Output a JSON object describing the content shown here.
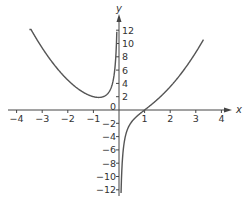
{
  "chart_data": {
    "type": "line",
    "title": "",
    "xlabel": "x",
    "ylabel": "y",
    "xlim": [
      -4.2,
      4.4
    ],
    "ylim": [
      -13,
      13
    ],
    "grid": false,
    "legend": "none",
    "x_ticks": [
      {
        "value": -4,
        "label": "−4"
      },
      {
        "value": -3,
        "label": "−3"
      },
      {
        "value": -2,
        "label": "−2"
      },
      {
        "value": -1,
        "label": "−1"
      },
      {
        "value": 1,
        "label": "1"
      },
      {
        "value": 2,
        "label": "2"
      },
      {
        "value": 3,
        "label": "3"
      },
      {
        "value": 4,
        "label": "4"
      }
    ],
    "origin_label": "0",
    "y_ticks": [
      {
        "value": 12,
        "label": "12"
      },
      {
        "value": 10,
        "label": "10"
      },
      {
        "value": 8,
        "label": "8"
      },
      {
        "value": 6,
        "label": "6"
      },
      {
        "value": 4,
        "label": "4"
      },
      {
        "value": 2,
        "label": "2"
      },
      {
        "value": -2,
        "label": "−2"
      },
      {
        "value": -4,
        "label": "−4"
      },
      {
        "value": -6,
        "label": "−6"
      },
      {
        "value": -8,
        "label": "−8"
      },
      {
        "value": -10,
        "label": "−10"
      },
      {
        "value": -12,
        "label": "−12"
      }
    ],
    "series": [
      {
        "name": "left branch (x < 0)",
        "function": "y = x^2 - 1/x",
        "x": [
          -3.5,
          -3.0,
          -2.5,
          -2.0,
          -1.5,
          -1.2,
          -1.0,
          -0.8,
          -0.6,
          -0.4,
          -0.3,
          -0.2,
          -0.15,
          -0.1,
          -0.085
        ],
        "y": [
          12.54,
          9.33,
          6.65,
          4.5,
          2.92,
          2.27,
          2.0,
          1.89,
          2.03,
          2.66,
          3.42,
          5.04,
          6.69,
          10.01,
          11.77
        ]
      },
      {
        "name": "right branch (x > 0)",
        "function": "y = x^2 - 1/x",
        "x": [
          0.08,
          0.1,
          0.15,
          0.2,
          0.3,
          0.4,
          0.5,
          0.7,
          1.0,
          1.5,
          2.0,
          2.5,
          3.0,
          3.3
        ],
        "y": [
          -12.49,
          -9.99,
          -6.64,
          -4.96,
          -3.24,
          -2.34,
          -1.75,
          -0.94,
          0.0,
          1.58,
          3.5,
          5.85,
          8.67,
          10.59
        ]
      }
    ]
  }
}
